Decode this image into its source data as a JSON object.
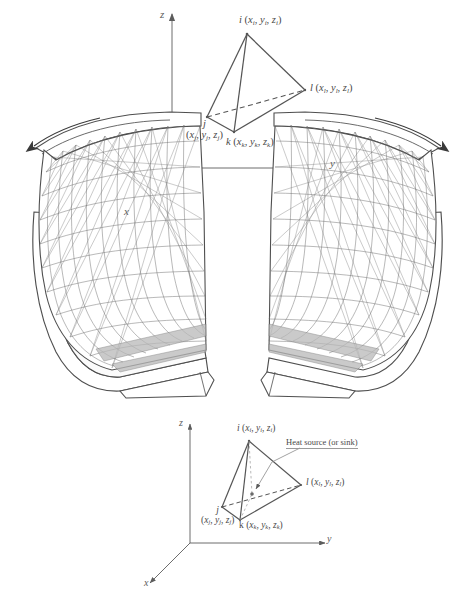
{
  "figure": {
    "background_color": "#ffffff",
    "line_color": "#555555",
    "mesh_color": "#707070",
    "text_color": "#4a4a4a"
  },
  "top_element": {
    "axes": {
      "z_label": "z",
      "y_label": "y",
      "x_label": "x"
    },
    "vertices": [
      {
        "node": "i",
        "coords": "(x",
        "coord_text": "i (xi, yi, zi)",
        "sub": "i"
      },
      {
        "node": "j",
        "coord_text": "j (xj, yj, zj)",
        "sub": "j"
      },
      {
        "node": "k",
        "coord_text": "k (xk, yk, zk)",
        "sub": "k"
      },
      {
        "node": "l",
        "coord_text": "l (xl, yl, zl)",
        "sub": "l"
      }
    ]
  },
  "bottom_element": {
    "axes": {
      "z_label": "z",
      "y_label": "y",
      "x_label": "x"
    },
    "annotation": "Heat source (or sink)",
    "vertices": [
      {
        "node": "i",
        "sub": "i"
      },
      {
        "node": "j",
        "sub": "j"
      },
      {
        "node": "k",
        "sub": "k"
      },
      {
        "node": "l",
        "sub": "l"
      }
    ]
  },
  "blades": {
    "left": {
      "name": "left-turbine-blade",
      "flow_arrow": "arrow-left"
    },
    "right": {
      "name": "right-turbine-blade",
      "flow_arrow": "arrow-up-left"
    }
  },
  "glyphs": {
    "x": "x",
    "y": "y",
    "z": "z",
    "i": "i",
    "j": "j",
    "k": "k",
    "l": "l",
    "open_paren": "(",
    "close_paren": ")",
    "comma": ","
  }
}
